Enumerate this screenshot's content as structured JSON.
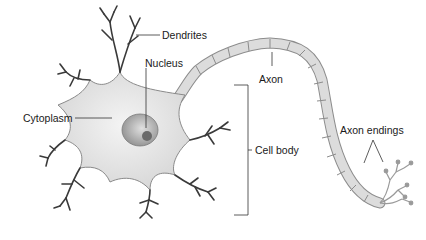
{
  "diagram": {
    "labels": {
      "dendrites": "Dendrites",
      "nucleus": "Nucleus",
      "cytoplasm": "Cytoplasm",
      "axon": "Axon",
      "cell_body": "Cell body",
      "axon_endings": "Axon endings"
    },
    "colors": {
      "cell_fill": "#e8e8e8",
      "cell_stroke": "#8a8a8a",
      "nucleus_fill": "#b8b8b8",
      "nucleolus_fill": "#6a6a6a",
      "dendrite_color": "#3a3a3a",
      "axon_fill": "#d9d9d9",
      "leader_line": "#333333"
    }
  }
}
